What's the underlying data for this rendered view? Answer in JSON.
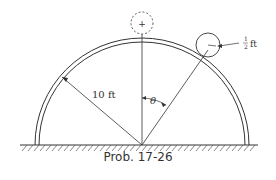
{
  "diagram": {
    "radius_label": "10 ft",
    "ball_radius_num": "1",
    "ball_radius_den": "2",
    "ball_radius_unit": "ft",
    "angle_label": "θ",
    "top_marker": "+",
    "caption": "Prob. 17-26"
  }
}
